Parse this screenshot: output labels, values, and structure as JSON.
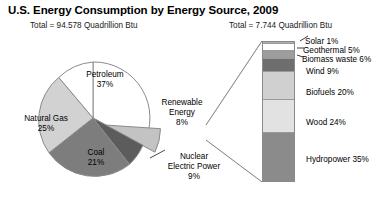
{
  "header": {
    "title": "U.S. Energy Consumption by Energy Source, 2009",
    "pie_total": "Total = 94.578 Quadrillion Btu",
    "bar_total": "Total = 7.744 Quadrillion Btu"
  },
  "pie_labels": {
    "petroleum": "Petroleum\n37%",
    "natural_gas": "Natural Gas\n25%",
    "coal": "Coal\n21%",
    "renewable": "Renewable\nEnergy\n8%",
    "nuclear": "Nuclear\nElectric Power\n9%"
  },
  "bar_labels": {
    "solar": "Solar 1%",
    "geothermal": "Geothermal 5%",
    "biomass": "Biomass waste 6%",
    "wind": "Wind 9%",
    "biofuels": "Biofuels 20%",
    "wood": "Wood 24%",
    "hydropower": "Hydropower 35%"
  },
  "colors": {
    "petroleum": "#ffffff",
    "natural_gas": "#d2d2d2",
    "coal": "#7d7d7d",
    "nuclear": "#5c5c5c",
    "renewable": "#c3c3c3",
    "solar": "#b0b0b0",
    "geothermal": "#ffffff",
    "biomass": "#9d9d9d",
    "wind": "#6e6e6e",
    "biofuels": "#d0d0d0",
    "wood": "#e2e2e2",
    "hydropower": "#8b8b8b",
    "outline": "#8a8a8a"
  },
  "chart_data": [
    {
      "type": "pie",
      "title": "U.S. Energy Consumption by Energy Source, 2009",
      "subtitle": "Total = 94.578 Quadrillion Btu",
      "total": 94.578,
      "units": "Quadrillion Btu",
      "categories": [
        "Petroleum",
        "Natural Gas",
        "Coal",
        "Nuclear Electric Power",
        "Renewable Energy"
      ],
      "values": [
        37,
        25,
        21,
        9,
        8
      ],
      "value_unit": "percent",
      "exploded_slice": "Renewable Energy",
      "legend": "none, labels drawn on slices"
    },
    {
      "type": "bar",
      "subtype": "stacked-single-column",
      "title": "Renewable Energy breakdown",
      "subtitle": "Total = 7.744 Quadrillion Btu",
      "total": 7.744,
      "units": "Quadrillion Btu",
      "categories": [
        "Solar",
        "Geothermal",
        "Biomass waste",
        "Wind",
        "Biofuels",
        "Wood",
        "Hydropower"
      ],
      "values": [
        1,
        5,
        6,
        9,
        20,
        24,
        35
      ],
      "value_unit": "percent",
      "stack_order_top_to_bottom": [
        "Solar",
        "Geothermal",
        "Biomass waste",
        "Wind",
        "Biofuels",
        "Wood",
        "Hydropower"
      ],
      "ylim": [
        0,
        100
      ],
      "grid": false,
      "legend": "none, labels to the right of each segment"
    }
  ]
}
